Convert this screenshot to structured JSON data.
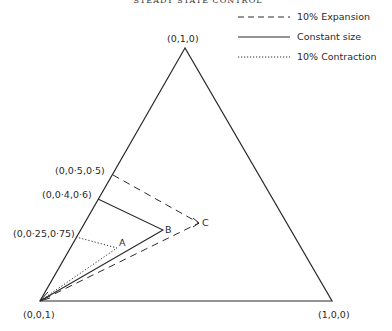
{
  "title": "STEADY STATE CONTROL",
  "legend": [
    {
      "style": "dashed",
      "label": "10% Expansion"
    },
    {
      "style": "solid",
      "label": "Constant size"
    },
    {
      "style": "dotted",
      "label": "10% Contraction"
    }
  ],
  "vertices": {
    "top": "(0,1,0)",
    "bottom_left": "(0,0,1)",
    "bottom_right": "(1,0,0)"
  },
  "edge_points": {
    "p50": "(0,0·5,0·5)",
    "p40": "(0,0·4,0·6)",
    "p25": "(0,0·25,0·75)"
  },
  "points": {
    "A": "A",
    "B": "B",
    "C": "C"
  },
  "colors": {
    "line": "#2a2a2a",
    "background": "#ffffff"
  }
}
